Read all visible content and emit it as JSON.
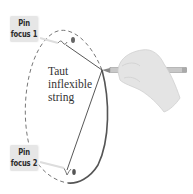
{
  "diagram": {
    "type": "ellipse-construction",
    "labels": {
      "pin1": [
        "Pin",
        "focus 1"
      ],
      "pin2": [
        "Pin",
        "focus 2"
      ],
      "string": [
        "Taut",
        "inflexible",
        "string"
      ]
    },
    "colors": {
      "label_bg": "#e6e6e6",
      "label_text": "#2a2a2a",
      "curve": "#555555",
      "dashed_curve": "#666666",
      "string": "#444444",
      "hand": "#dcdcdc",
      "pencil": "#9a9a9a"
    }
  }
}
